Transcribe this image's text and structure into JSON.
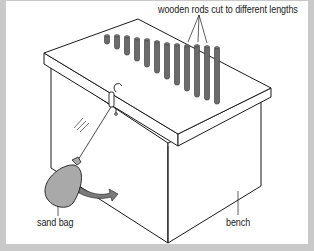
{
  "diagram": {
    "labels": {
      "rods": "wooden rods cut to different lengths",
      "sand_bag": "sand bag",
      "bench": "bench"
    },
    "colors": {
      "frame_border": "#c9c9c9",
      "background": "#ffffff",
      "rod_fill": "#6b6b6b",
      "bag_fill": "#a9a9a9",
      "arrow_fill": "#7a7a7a",
      "line": "#1a1a1a"
    },
    "rods": [
      {
        "x": 107,
        "top": 35,
        "bottom": 44
      },
      {
        "x": 117,
        "top": 35,
        "bottom": 49
      },
      {
        "x": 127,
        "top": 36,
        "bottom": 55
      },
      {
        "x": 137,
        "top": 38,
        "bottom": 61
      },
      {
        "x": 147,
        "top": 39,
        "bottom": 67
      },
      {
        "x": 157,
        "top": 41,
        "bottom": 73
      },
      {
        "x": 167,
        "top": 43,
        "bottom": 79
      },
      {
        "x": 177,
        "top": 44,
        "bottom": 85
      },
      {
        "x": 187,
        "top": 45,
        "bottom": 91
      },
      {
        "x": 197,
        "top": 45,
        "bottom": 97
      },
      {
        "x": 207,
        "top": 46,
        "bottom": 100
      },
      {
        "x": 217,
        "top": 47,
        "bottom": 104
      }
    ]
  }
}
